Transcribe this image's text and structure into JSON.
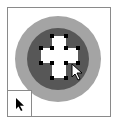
{
  "canvas": {
    "shape": "cross-with-circles",
    "colors": {
      "outer_ring": "#a4a4a4",
      "inner_circle": "#575757",
      "cross": "#ffffff",
      "handles": "#000000",
      "frame_border": "#8a8a8a"
    }
  },
  "tool_indicator": {
    "icon": "selection-arrow-icon"
  },
  "cursor": {
    "icon": "arrow-pointer-icon"
  }
}
